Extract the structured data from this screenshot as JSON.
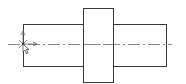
{
  "drawing": {
    "type": "stepped-shaft-side-view",
    "colors": {
      "outline": "#3a3a3a",
      "centerline": "#8a8a8a",
      "background": "#ffffff"
    },
    "parts": [
      {
        "name": "left-shaft-segment",
        "x": 23,
        "y": 24,
        "width": 60,
        "height": 42
      },
      {
        "name": "collar",
        "x": 83,
        "y": 8,
        "width": 30,
        "height": 74
      },
      {
        "name": "right-shaft-segment",
        "x": 113,
        "y": 24,
        "width": 53,
        "height": 42
      }
    ],
    "centerline": {
      "y": 44,
      "x_start": 8,
      "x_end": 172,
      "style": "dash-dot"
    },
    "origin_marker": {
      "x": 23,
      "y": 44,
      "icon": "ucs-origin-axes"
    },
    "cursor": {
      "x": 23,
      "y": 44,
      "icon": "mouse-pointer-icon"
    }
  }
}
